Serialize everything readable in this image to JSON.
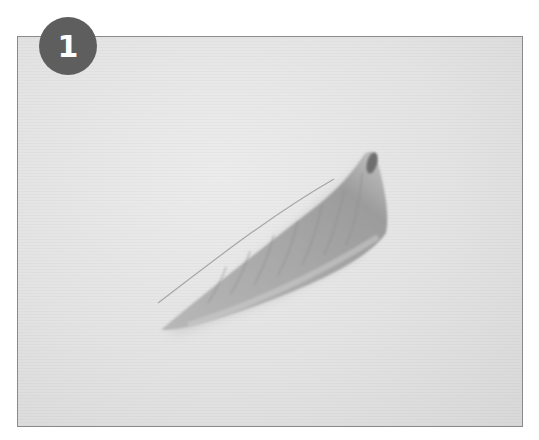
{
  "step": {
    "number": "1",
    "badge_color": "#5e5e5e"
  },
  "photo": {
    "subject": "fish-fillet",
    "background_color": "#e4e4e4",
    "border_color": "#8a8a8a"
  }
}
